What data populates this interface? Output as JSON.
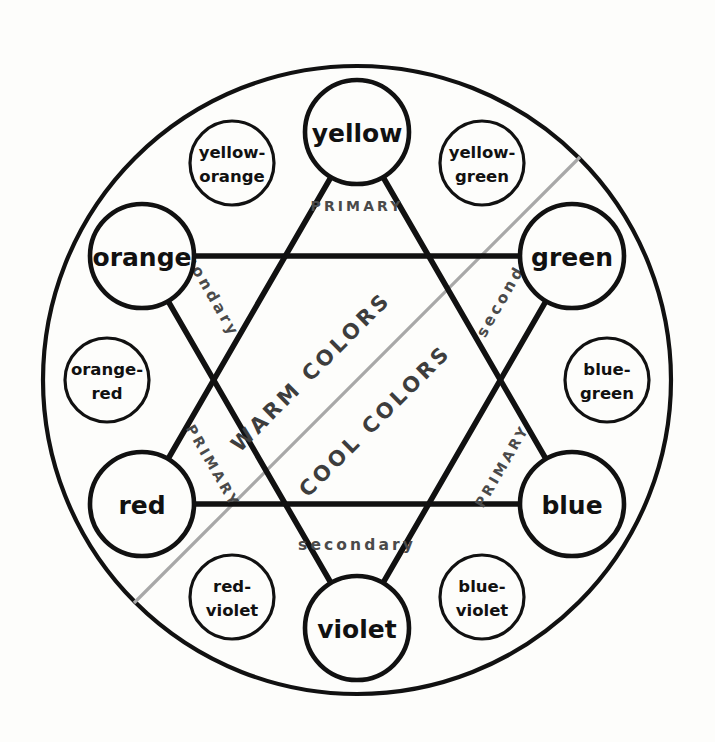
{
  "diagram": {
    "geometry": {
      "center_x": 357,
      "center_y": 380,
      "outer_radius": 314,
      "major_ring_radius": 248,
      "minor_ring_radius": 250,
      "major_circle_radius": 52,
      "minor_circle_radius": 42
    },
    "colors": {
      "background": "#fdfdfb",
      "stroke": "#111111",
      "divider": "#a8a8a8",
      "edge_label": "#4a4a4a",
      "temp_label": "#3d3d3d"
    }
  },
  "major_nodes": [
    {
      "id": "yellow",
      "label": "yellow",
      "kind": "primary",
      "angle_deg": -90,
      "cx": 357,
      "cy": 132
    },
    {
      "id": "green",
      "label": "green",
      "kind": "secondary",
      "angle_deg": -30,
      "cx": 572,
      "cy": 256
    },
    {
      "id": "blue",
      "label": "blue",
      "kind": "primary",
      "angle_deg": 30,
      "cx": 572,
      "cy": 504
    },
    {
      "id": "violet",
      "label": "violet",
      "kind": "secondary",
      "angle_deg": 90,
      "cx": 357,
      "cy": 628
    },
    {
      "id": "red",
      "label": "red",
      "kind": "primary",
      "angle_deg": 150,
      "cx": 142,
      "cy": 504
    },
    {
      "id": "orange",
      "label": "orange",
      "kind": "secondary",
      "angle_deg": -150,
      "cx": 142,
      "cy": 256
    }
  ],
  "minor_nodes": [
    {
      "id": "yellow-green",
      "line1": "yellow-",
      "line2": "green",
      "angle_deg": -60,
      "cx": 482,
      "cy": 163
    },
    {
      "id": "blue-green",
      "line1": "blue-",
      "line2": "green",
      "angle_deg": 0,
      "cx": 607,
      "cy": 380
    },
    {
      "id": "blue-violet",
      "line1": "blue-",
      "line2": "violet",
      "angle_deg": 60,
      "cx": 482,
      "cy": 597
    },
    {
      "id": "red-violet",
      "line1": "red-",
      "line2": "violet",
      "angle_deg": 120,
      "cx": 232,
      "cy": 597
    },
    {
      "id": "orange-red",
      "line1": "orange-",
      "line2": "red",
      "angle_deg": 180,
      "cx": 107,
      "cy": 380
    },
    {
      "id": "yellow-orange",
      "line1": "yellow-",
      "line2": "orange",
      "angle_deg": -120,
      "cx": 232,
      "cy": 163
    }
  ],
  "edge_labels": [
    {
      "id": "primary-top",
      "text": "PRIMARY",
      "kind": "primary",
      "x": 357,
      "y": 206,
      "rotate": 0
    },
    {
      "id": "primary-lower-left",
      "text": "PRIMARY",
      "kind": "primary",
      "x": 213,
      "y": 466,
      "rotate": 60
    },
    {
      "id": "primary-lower-right",
      "text": "PRIMARY",
      "kind": "primary",
      "x": 502,
      "y": 466,
      "rotate": -60
    },
    {
      "id": "secondary-upper-left",
      "text": "secondary",
      "kind": "secondary",
      "x": 206,
      "y": 285,
      "rotate": 60
    },
    {
      "id": "secondary-upper-right",
      "text": "secondary",
      "kind": "secondary",
      "x": 510,
      "y": 285,
      "rotate": -60
    },
    {
      "id": "secondary-bottom",
      "text": "secondary",
      "kind": "secondary",
      "x": 357,
      "y": 545,
      "rotate": 0
    }
  ],
  "temperature_labels": [
    {
      "id": "warm-colors",
      "text": "WARM COLORS",
      "x": 311,
      "y": 372,
      "rotate": -45
    },
    {
      "id": "cool-colors",
      "text": "COOL COLORS",
      "x": 375,
      "y": 421,
      "rotate": -45
    }
  ],
  "divider": {
    "id": "warm-cool-divider",
    "x1": 134,
    "y1": 603,
    "x2": 580,
    "y2": 157
  },
  "triangles": {
    "primary": {
      "label": "PRIMARY",
      "points": "357,132 572,504 142,504"
    },
    "secondary": {
      "label": "secondary",
      "points": "357,628 142,256 572,256"
    }
  }
}
